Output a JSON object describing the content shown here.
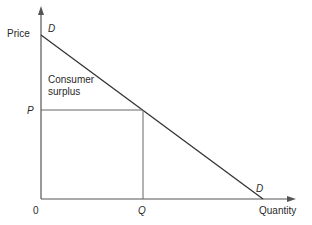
{
  "diagram": {
    "type": "consumer-surplus",
    "axes": {
      "y_label": "Price",
      "x_label": "Quantity",
      "origin_label": "0"
    },
    "demand_curve": {
      "label_top": "D",
      "label_bottom": "D"
    },
    "price_level": {
      "label": "P"
    },
    "quantity_level": {
      "label": "Q"
    },
    "region": {
      "label_line1": "Consumer",
      "label_line2": "surplus"
    },
    "colors": {
      "axis": "#555555",
      "curve": "#333333",
      "guide": "#666666",
      "text": "#2a2a2a"
    }
  }
}
